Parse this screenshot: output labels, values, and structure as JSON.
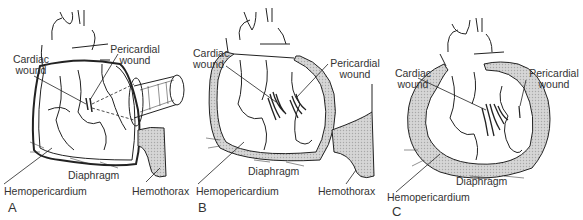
{
  "figure": {
    "panels": [
      {
        "letter": "A",
        "labels": {
          "cardiac_wound_1": "Cardiac",
          "cardiac_wound_2": "wound",
          "pericardial_wound_1": "Pericardial",
          "pericardial_wound_2": "wound",
          "diaphragm": "Diaphragm",
          "hemopericardium": "Hemopericardium",
          "hemothorax": "Hemothorax"
        }
      },
      {
        "letter": "B",
        "labels": {
          "cardiac_wound_1": "Cardiac",
          "cardiac_wound_2": "wound",
          "pericardial_wound_1": "Pericardial",
          "pericardial_wound_2": "wound",
          "diaphragm": "Diaphragm",
          "hemopericardium": "Hemopericardium",
          "hemothorax": "Hemothorax"
        }
      },
      {
        "letter": "C",
        "labels": {
          "cardiac_wound_1": "Cardiac",
          "cardiac_wound_2": "wound",
          "pericardial_wound_1": "Pericardial",
          "pericardial_wound_2": "wound",
          "diaphragm": "Diaphragm",
          "hemopericardium": "Hemopericardium"
        }
      }
    ],
    "colors": {
      "line": "#222222",
      "blood_fill": "#cfcfcf",
      "label": "#333333"
    }
  }
}
